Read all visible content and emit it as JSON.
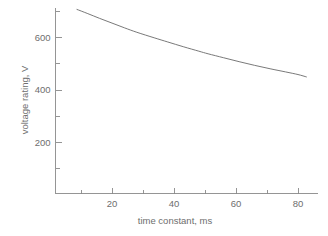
{
  "chart_data": {
    "type": "line",
    "title": "",
    "xlabel": "time constant, ms",
    "ylabel": "voltage rating, V",
    "xlim": [
      0,
      88
    ],
    "ylim": [
      0,
      740
    ],
    "grid": false,
    "legend": null,
    "x_major_ticks": [
      20,
      40,
      60,
      80
    ],
    "x_minor_ticks": [
      10,
      30,
      50,
      70
    ],
    "y_major_ticks": [
      200,
      400,
      600
    ],
    "y_minor_ticks": [
      100,
      300,
      500,
      700
    ],
    "x_tick_labels": [
      "20",
      "40",
      "60",
      "80"
    ],
    "y_tick_labels": [
      "200",
      "400",
      "600"
    ],
    "series": [
      {
        "name": "voltage rating",
        "color": "#6a6a6a",
        "x": [
          8.7,
          12,
          16,
          20,
          24,
          28,
          33.6,
          38,
          43,
          48,
          51,
          56,
          61,
          66,
          71,
          76,
          80,
          82.7
        ],
        "y": [
          705,
          690,
          671,
          653,
          635,
          618,
          597,
          581,
          563,
          546,
          536,
          521,
          506,
          492,
          479,
          467,
          457,
          448
        ]
      }
    ]
  },
  "axes": {
    "x_title": "time constant, ms",
    "y_title": "voltage rating, V"
  },
  "style": {
    "background": "#ffffff",
    "axis_color": "#8a8a8a",
    "text_color": "#6e6e6e",
    "line_color": "#6a6a6a"
  }
}
